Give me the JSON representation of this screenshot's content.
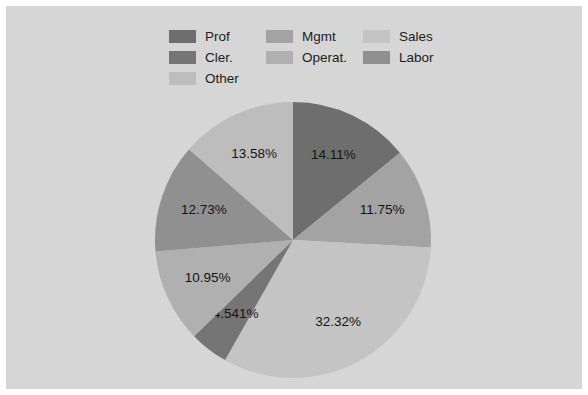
{
  "figure": {
    "background_color": "#d6d6d6",
    "page_background_color": "#ffffff"
  },
  "legend": {
    "entries": [
      {
        "label": "Prof",
        "color": "#6e6e6e"
      },
      {
        "label": "Cler.",
        "color": "#757575"
      },
      {
        "label": "Other",
        "color": "#bdbdbd"
      },
      {
        "label": "Mgmt",
        "color": "#a3a3a3"
      },
      {
        "label": "Operat.",
        "color": "#b0b0b0"
      },
      {
        "label": "Sales",
        "color": "#c4c4c4"
      },
      {
        "label": "Labor",
        "color": "#909090"
      }
    ]
  },
  "chart_data": {
    "type": "pie",
    "title": "",
    "labels": [
      "Prof",
      "Mgmt",
      "Sales",
      "Cler.",
      "Operat.",
      "Labor",
      "Other"
    ],
    "values": [
      14.11,
      11.75,
      32.32,
      4.541,
      10.95,
      12.73,
      13.58
    ],
    "value_labels": [
      "14.11%",
      "11.75%",
      "32.32%",
      "4.541%",
      "10.95%",
      "12.73%",
      "13.58%"
    ],
    "colors": [
      "#6e6e6e",
      "#a3a3a3",
      "#c4c4c4",
      "#757575",
      "#b0b0b0",
      "#909090",
      "#bdbdbd"
    ],
    "units": "percent",
    "start_angle_deg": 90,
    "direction": "clockwise",
    "legend_position": "top",
    "label_text_color": "#141414",
    "center_x": 287,
    "center_y": 234,
    "radius": 138
  }
}
